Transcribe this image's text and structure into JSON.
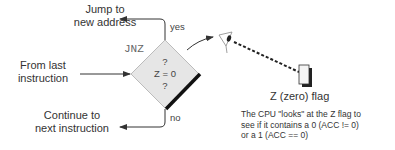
{
  "diagram": {
    "decision": {
      "instruction": "JNZ",
      "lines": [
        "?",
        "Z = 0",
        "?"
      ]
    },
    "labels": {
      "jump": [
        "Jump to",
        "new address"
      ],
      "from_last": [
        "From last",
        "instruction"
      ],
      "continue": [
        "Continue to",
        "next instruction"
      ],
      "yes": "yes",
      "no": "no",
      "flag": "Z (zero) flag"
    },
    "description": [
      "The CPU \"looks\" at the Z flag to",
      "see if it contains a 0 (ACC != 0)",
      "or a 1 (ACC == 0)"
    ],
    "colors": {
      "line": "#333333",
      "diamond_fill": "#e8e8e8",
      "diamond_shadow": "#111111"
    }
  }
}
